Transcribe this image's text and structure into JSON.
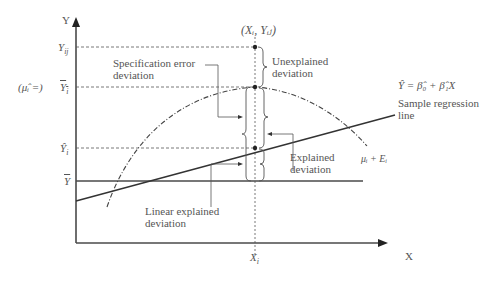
{
  "diagram": {
    "axes": {
      "y_label": "Y",
      "x_label": "X",
      "xi_label": "X",
      "xi_sub": "i"
    },
    "y_ticks": {
      "yij": {
        "base": "Y",
        "sub": "ij"
      },
      "ybar_i": {
        "base": "Y",
        "sub": "i",
        "note": "(μ̂ᵢ =)"
      },
      "yhat_i": {
        "base": "Ŷ",
        "sub": "i"
      },
      "ybar": {
        "base": "Y"
      }
    },
    "point_label": "(Xᵢ, Yᵢⱼ)",
    "annotations": {
      "spec_error": [
        "Specification error",
        "deviation"
      ],
      "unexplained": [
        "Unexplained",
        "deviation"
      ],
      "explained": [
        "Explained",
        "deviation"
      ],
      "linear_explained": [
        "Linear explained",
        "deviation"
      ],
      "regression_eq": "Ŷ = β̂₀ + β̂₁X",
      "regression_name": [
        "Sample regression",
        "line"
      ],
      "curve_label": "μᵢ + Eᵢ"
    },
    "colors": {
      "line": "#3a3a3a",
      "text": "#555555"
    }
  }
}
